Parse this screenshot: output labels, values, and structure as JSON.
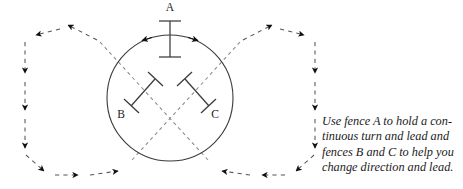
{
  "figure": {
    "background_color": "#ffffff",
    "line_color": "#3a3a3a",
    "dash_color": "#555555",
    "arrow_color": "#111111",
    "text_color": "#1b1b1b"
  },
  "arena": {
    "circle": {
      "name": "riding-circle",
      "cx": 170,
      "cy": 98,
      "r": 63
    }
  },
  "fences": [
    {
      "id": "A",
      "label": "A",
      "label_x": 170,
      "label_y": 11,
      "orientation": "vertical",
      "x1": 170,
      "y1": 21,
      "x2": 170,
      "y2": 57,
      "cap_half_length": 11
    },
    {
      "id": "B",
      "label": "B",
      "label_x": 121,
      "label_y": 118,
      "orientation": "diagonal-up-right",
      "x1": 131,
      "y1": 106,
      "x2": 155,
      "y2": 79,
      "cap_half_length": 10
    },
    {
      "id": "C",
      "label": "C",
      "label_x": 215,
      "label_y": 118,
      "orientation": "diagonal-down-right",
      "x1": 185,
      "y1": 79,
      "x2": 209,
      "y2": 106,
      "cap_half_length": 10
    }
  ],
  "dashed_paths": {
    "cross_center_x": 170,
    "cross_center_y": 119,
    "description": "Two dashed lines cross inside the circle and run out to left and right loops"
  },
  "caption": {
    "name": "figure-caption",
    "text": "Use fence A to hold a con-\ntinuous turn and lead and\nfences B and C to help you\nchange direction and lead."
  }
}
